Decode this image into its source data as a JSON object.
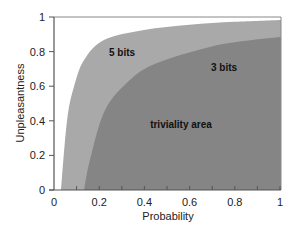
{
  "chart_data": {
    "type": "area",
    "title": "",
    "xlabel": "Probability",
    "ylabel": "Unpleasantness",
    "xlim": [
      0,
      1
    ],
    "ylim": [
      0,
      1
    ],
    "grid": false,
    "x_ticks": [
      "0",
      "0.2",
      "0.4",
      "0.6",
      "0.8",
      "1"
    ],
    "x_minor_ticks": [
      0.1,
      0.2,
      0.3,
      0.4,
      0.5,
      0.6,
      0.7,
      0.8,
      0.9
    ],
    "y_ticks": [
      "0",
      "0.2",
      "0.4",
      "0.6",
      "0.8",
      "1"
    ],
    "series": [
      {
        "name": "5 bits",
        "color": "#a9a9a9",
        "x": [
          0.031,
          0.058,
          0.088,
          0.133,
          0.221,
          0.398,
          0.6,
          0.8,
          1.0
        ],
        "y": [
          0.0,
          0.405,
          0.595,
          0.751,
          0.867,
          0.925,
          0.955,
          0.972,
          0.983
        ]
      },
      {
        "name": "3 bits",
        "color": "#858585",
        "x": [
          0.133,
          0.159,
          0.226,
          0.336,
          0.456,
          0.69,
          0.85,
          1.0
        ],
        "y": [
          0.0,
          0.173,
          0.462,
          0.636,
          0.734,
          0.827,
          0.862,
          0.884
        ]
      }
    ],
    "annotations": [
      {
        "text": "5 bits",
        "x": 0.29,
        "y": 0.79
      },
      {
        "text": "3 bits",
        "x": 0.69,
        "y": 0.7
      },
      {
        "text": "triviality area",
        "x": 0.55,
        "y": 0.37
      }
    ]
  },
  "labels": {
    "five_bits": "5 bits",
    "three_bits": "3 bits",
    "triviality": "triviality area",
    "xlabel": "Probability",
    "ylabel": "Unpleasantness",
    "x_ticks": [
      "0",
      "0.2",
      "0.4",
      "0.6",
      "0.8",
      "1"
    ],
    "y_ticks": [
      "0",
      "0.2",
      "0.4",
      "0.6",
      "0.8",
      "1"
    ]
  },
  "colors": {
    "five_bits_fill": "#a9a9a9",
    "three_bits_fill": "#858585",
    "axis": "#555555",
    "frame": "#888888"
  }
}
